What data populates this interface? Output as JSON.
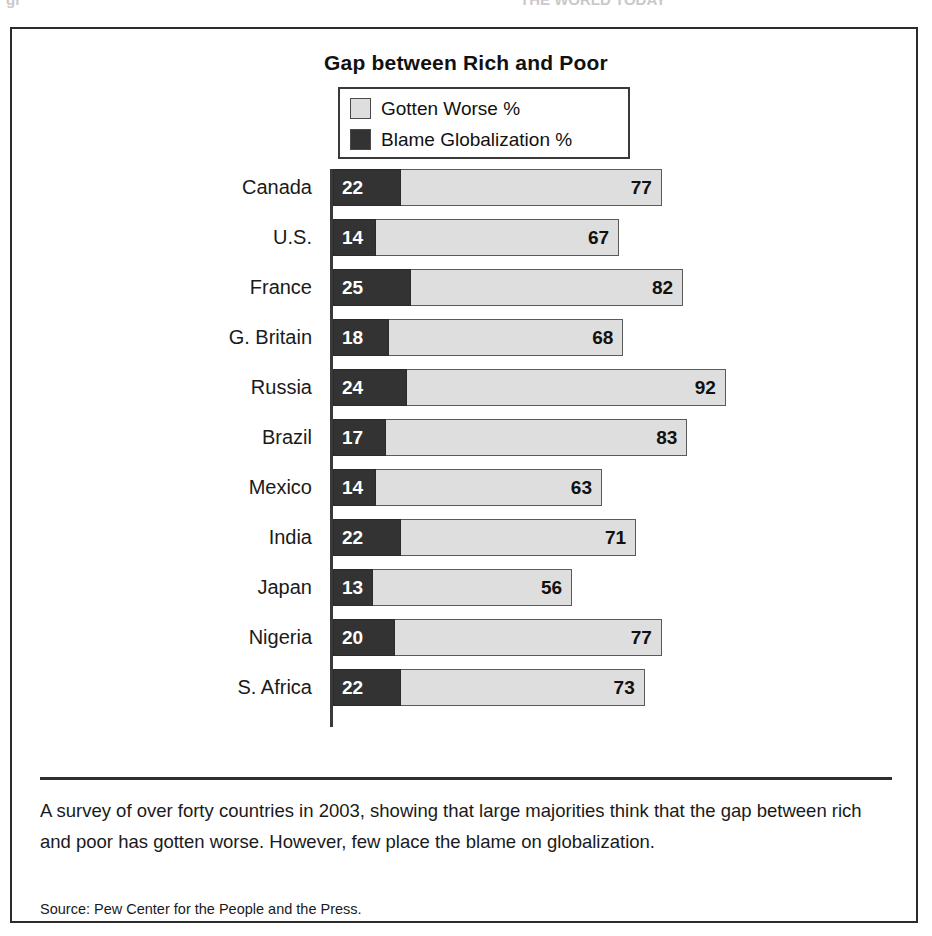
{
  "top_ghost": {
    "left_fragment": "gr",
    "right_fragment": "THE WORLD TODAY"
  },
  "figure": {
    "title": "Gap between Rich and Poor",
    "legend": [
      {
        "label": "Gotten Worse %",
        "color": "#dedede",
        "swatch_name": "legend-swatch-gotten-worse"
      },
      {
        "label": "Blame Globalization %",
        "color": "#333333",
        "swatch_name": "legend-swatch-blame-globalization"
      }
    ],
    "caption": "A survey of over forty countries in 2003, showing that large majorities think that the gap between rich and poor has gotten worse. However, few place the blame on globalization.",
    "source": "Source: Pew Center for the People and the Press."
  },
  "chart_data": {
    "type": "bar",
    "orientation": "horizontal",
    "title": "Gap between Rich and Poor",
    "xlabel": "",
    "ylabel": "",
    "xlim": [
      0,
      100
    ],
    "grid": false,
    "legend_position": "top-center",
    "categories": [
      "Canada",
      "U.S.",
      "France",
      "G. Britain",
      "Russia",
      "Brazil",
      "Mexico",
      "India",
      "Japan",
      "Nigeria",
      "S. Africa"
    ],
    "series": [
      {
        "name": "Gotten Worse %",
        "color": "#dedede",
        "values": [
          77,
          67,
          82,
          68,
          92,
          83,
          63,
          71,
          56,
          77,
          73
        ]
      },
      {
        "name": "Blame Globalization %",
        "color": "#333333",
        "values": [
          22,
          14,
          25,
          18,
          24,
          17,
          14,
          22,
          13,
          20,
          22
        ]
      }
    ],
    "rows": [
      {
        "country": "Canada",
        "gotten_worse": 77,
        "blame_globalization": 22
      },
      {
        "country": "U.S.",
        "gotten_worse": 67,
        "blame_globalization": 14
      },
      {
        "country": "France",
        "gotten_worse": 82,
        "blame_globalization": 25
      },
      {
        "country": "G. Britain",
        "gotten_worse": 68,
        "blame_globalization": 18
      },
      {
        "country": "Russia",
        "gotten_worse": 92,
        "blame_globalization": 24
      },
      {
        "country": "Brazil",
        "gotten_worse": 83,
        "blame_globalization": 17
      },
      {
        "country": "Mexico",
        "gotten_worse": 63,
        "blame_globalization": 14
      },
      {
        "country": "India",
        "gotten_worse": 71,
        "blame_globalization": 22
      },
      {
        "country": "Japan",
        "gotten_worse": 56,
        "blame_globalization": 13
      },
      {
        "country": "Nigeria",
        "gotten_worse": 77,
        "blame_globalization": 20
      },
      {
        "country": "S. Africa",
        "gotten_worse": 73,
        "blame_globalization": 22
      }
    ]
  },
  "render_hints": {
    "light_px_per_unit": 4.27,
    "dark_px_per_unit": 3.1,
    "row_pitch": 50,
    "bar_height": 37
  }
}
